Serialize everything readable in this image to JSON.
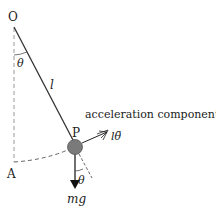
{
  "diagram": {
    "labels": {
      "pivot": "O",
      "angle_top": "θ",
      "length": "l",
      "bob": "P",
      "rest_point": "A",
      "accel_text": "acceleration component",
      "accel_symbol": "lθ̈",
      "angle_bottom": "θ",
      "weight": "mg"
    },
    "colors": {
      "line": "#333333",
      "dashed": "#999999",
      "bob_fill": "#7a7a7a",
      "text": "#222222"
    }
  }
}
